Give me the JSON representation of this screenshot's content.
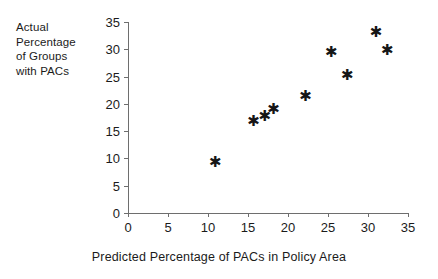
{
  "chart_data": {
    "type": "scatter",
    "title": "",
    "xlabel": "Predicted Percentage of PACs in Policy Area",
    "ylabel": "Actual Percentage of Groups with PACs",
    "ylabel_lines": [
      "Actual",
      "Percentage",
      "of Groups",
      "with PACs"
    ],
    "xlim": [
      0,
      35
    ],
    "ylim": [
      0,
      35
    ],
    "xticks": [
      0,
      5,
      10,
      15,
      20,
      25,
      30,
      35
    ],
    "yticks": [
      0,
      5,
      10,
      15,
      20,
      25,
      30,
      35
    ],
    "xticklabels": [
      "0",
      "5",
      "10",
      "15",
      "20",
      "25",
      "30",
      "35"
    ],
    "yticklabels": [
      "0",
      "5",
      "10",
      "15",
      "20",
      "25",
      "30",
      "35"
    ],
    "grid": false,
    "legend": false,
    "marker": "asterisk",
    "marker_glyph": "✱",
    "marker_color": "#161616",
    "axis_color": "#6e6e6e",
    "background_color": "#ffffff",
    "series": [
      {
        "name": "Policy areas",
        "points": [
          {
            "x": 10.8,
            "y": 9.2
          },
          {
            "x": 15.6,
            "y": 16.7
          },
          {
            "x": 17.0,
            "y": 17.6
          },
          {
            "x": 18.1,
            "y": 18.9
          },
          {
            "x": 22.1,
            "y": 21.4
          },
          {
            "x": 25.3,
            "y": 29.4
          },
          {
            "x": 27.3,
            "y": 25.2
          },
          {
            "x": 30.9,
            "y": 33.0
          },
          {
            "x": 32.3,
            "y": 29.7
          }
        ]
      }
    ]
  }
}
